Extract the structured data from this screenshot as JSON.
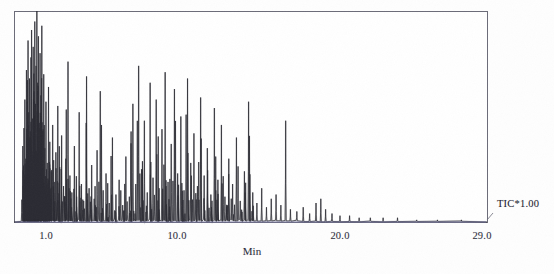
{
  "chart_data": {
    "type": "line",
    "title": "",
    "subtitle": "",
    "xlabel": "Min",
    "ylabel": "",
    "xlim": [
      0.0,
      29.6
    ],
    "ylim": [
      0,
      100
    ],
    "grid": false,
    "legend_position": "right",
    "series_label": "TIC*1.00",
    "axis_ticks": [
      {
        "label": "1.0",
        "value": 1.0,
        "px": 46
      },
      {
        "label": "10.0",
        "value": 10.0,
        "px": 177
      },
      {
        "label": "20.0",
        "value": 20.0,
        "px": 340
      },
      {
        "label": "29.0",
        "value": 29.0,
        "px": 482
      }
    ],
    "series": [
      {
        "name": "TIC*1.00",
        "color": "#2b2b33",
        "baseline_color": "#6f6f9c",
        "peaks": [
          {
            "x": 0.55,
            "h": 36
          },
          {
            "x": 0.62,
            "h": 22
          },
          {
            "x": 0.68,
            "h": 58
          },
          {
            "x": 0.73,
            "h": 30
          },
          {
            "x": 0.78,
            "h": 72
          },
          {
            "x": 0.83,
            "h": 44
          },
          {
            "x": 0.88,
            "h": 86
          },
          {
            "x": 0.92,
            "h": 52
          },
          {
            "x": 0.97,
            "h": 68
          },
          {
            "x": 1.02,
            "h": 40
          },
          {
            "x": 1.06,
            "h": 78
          },
          {
            "x": 1.1,
            "h": 91
          },
          {
            "x": 1.15,
            "h": 49
          },
          {
            "x": 1.2,
            "h": 83
          },
          {
            "x": 1.25,
            "h": 62
          },
          {
            "x": 1.3,
            "h": 95
          },
          {
            "x": 1.34,
            "h": 56
          },
          {
            "x": 1.38,
            "h": 74
          },
          {
            "x": 1.43,
            "h": 100
          },
          {
            "x": 1.48,
            "h": 66
          },
          {
            "x": 1.53,
            "h": 88
          },
          {
            "x": 1.58,
            "h": 47
          },
          {
            "x": 1.63,
            "h": 80
          },
          {
            "x": 1.68,
            "h": 60
          },
          {
            "x": 1.74,
            "h": 93
          },
          {
            "x": 1.8,
            "h": 43
          },
          {
            "x": 1.86,
            "h": 70
          },
          {
            "x": 1.93,
            "h": 35
          },
          {
            "x": 2.0,
            "h": 57
          },
          {
            "x": 2.08,
            "h": 28
          },
          {
            "x": 2.16,
            "h": 64
          },
          {
            "x": 2.24,
            "h": 38
          },
          {
            "x": 2.33,
            "h": 24
          },
          {
            "x": 2.42,
            "h": 46
          },
          {
            "x": 2.52,
            "h": 19
          },
          {
            "x": 2.62,
            "h": 33
          },
          {
            "x": 2.74,
            "h": 55
          },
          {
            "x": 2.86,
            "h": 26
          },
          {
            "x": 2.98,
            "h": 41
          },
          {
            "x": 3.1,
            "h": 17
          },
          {
            "x": 3.24,
            "h": 30
          },
          {
            "x": 3.38,
            "h": 76
          },
          {
            "x": 3.5,
            "h": 22
          },
          {
            "x": 3.62,
            "h": 14
          },
          {
            "x": 3.78,
            "h": 36
          },
          {
            "x": 3.92,
            "h": 12
          },
          {
            "x": 4.08,
            "h": 52
          },
          {
            "x": 4.22,
            "h": 18
          },
          {
            "x": 4.36,
            "h": 10
          },
          {
            "x": 4.54,
            "h": 69
          },
          {
            "x": 4.7,
            "h": 16
          },
          {
            "x": 4.86,
            "h": 27
          },
          {
            "x": 5.02,
            "h": 11
          },
          {
            "x": 5.2,
            "h": 34
          },
          {
            "x": 5.4,
            "h": 62
          },
          {
            "x": 5.58,
            "h": 15
          },
          {
            "x": 5.76,
            "h": 23
          },
          {
            "x": 5.96,
            "h": 9
          },
          {
            "x": 6.16,
            "h": 40
          },
          {
            "x": 6.38,
            "h": 13
          },
          {
            "x": 6.58,
            "h": 20
          },
          {
            "x": 6.8,
            "h": 8
          },
          {
            "x": 7.0,
            "h": 31
          },
          {
            "x": 7.22,
            "h": 12
          },
          {
            "x": 7.44,
            "h": 56
          },
          {
            "x": 7.62,
            "h": 18
          },
          {
            "x": 7.8,
            "h": 74
          },
          {
            "x": 7.98,
            "h": 25
          },
          {
            "x": 8.16,
            "h": 48
          },
          {
            "x": 8.34,
            "h": 14
          },
          {
            "x": 8.52,
            "h": 66
          },
          {
            "x": 8.7,
            "h": 21
          },
          {
            "x": 8.9,
            "h": 58
          },
          {
            "x": 9.08,
            "h": 16
          },
          {
            "x": 9.26,
            "h": 44
          },
          {
            "x": 9.46,
            "h": 71
          },
          {
            "x": 9.64,
            "h": 19
          },
          {
            "x": 9.84,
            "h": 37
          },
          {
            "x": 10.04,
            "h": 63
          },
          {
            "x": 10.24,
            "h": 23
          },
          {
            "x": 10.44,
            "h": 50
          },
          {
            "x": 10.64,
            "h": 15
          },
          {
            "x": 10.86,
            "h": 68
          },
          {
            "x": 11.06,
            "h": 28
          },
          {
            "x": 11.26,
            "h": 42
          },
          {
            "x": 11.48,
            "h": 17
          },
          {
            "x": 11.68,
            "h": 59
          },
          {
            "x": 11.9,
            "h": 22
          },
          {
            "x": 12.1,
            "h": 35
          },
          {
            "x": 12.32,
            "h": 13
          },
          {
            "x": 12.54,
            "h": 54
          },
          {
            "x": 12.76,
            "h": 20
          },
          {
            "x": 12.98,
            "h": 46
          },
          {
            "x": 13.2,
            "h": 12
          },
          {
            "x": 13.44,
            "h": 30
          },
          {
            "x": 13.68,
            "h": 18
          },
          {
            "x": 13.92,
            "h": 40
          },
          {
            "x": 14.16,
            "h": 10
          },
          {
            "x": 14.42,
            "h": 24
          },
          {
            "x": 14.68,
            "h": 57
          },
          {
            "x": 14.94,
            "h": 14
          },
          {
            "x": 15.2,
            "h": 9
          },
          {
            "x": 15.5,
            "h": 16
          },
          {
            "x": 15.8,
            "h": 7
          },
          {
            "x": 16.1,
            "h": 11
          },
          {
            "x": 16.4,
            "h": 13
          },
          {
            "x": 16.7,
            "h": 8
          },
          {
            "x": 17.0,
            "h": 48
          },
          {
            "x": 17.3,
            "h": 6
          },
          {
            "x": 17.7,
            "h": 5
          },
          {
            "x": 18.1,
            "h": 7
          },
          {
            "x": 18.5,
            "h": 4
          },
          {
            "x": 18.9,
            "h": 9
          },
          {
            "x": 19.2,
            "h": 11
          },
          {
            "x": 19.5,
            "h": 6
          },
          {
            "x": 19.9,
            "h": 4
          },
          {
            "x": 20.4,
            "h": 3
          },
          {
            "x": 21.0,
            "h": 3
          },
          {
            "x": 21.6,
            "h": 2
          },
          {
            "x": 22.3,
            "h": 2
          },
          {
            "x": 23.1,
            "h": 2
          },
          {
            "x": 24.0,
            "h": 2
          },
          {
            "x": 25.2,
            "h": 1
          },
          {
            "x": 26.5,
            "h": 1
          },
          {
            "x": 28.0,
            "h": 1
          }
        ]
      }
    ]
  },
  "plot": {
    "frame_color": "#6b6b78",
    "background": "#ffffff",
    "left_px": 14,
    "top_px": 11,
    "right_px": 487,
    "bottom_px": 222
  }
}
